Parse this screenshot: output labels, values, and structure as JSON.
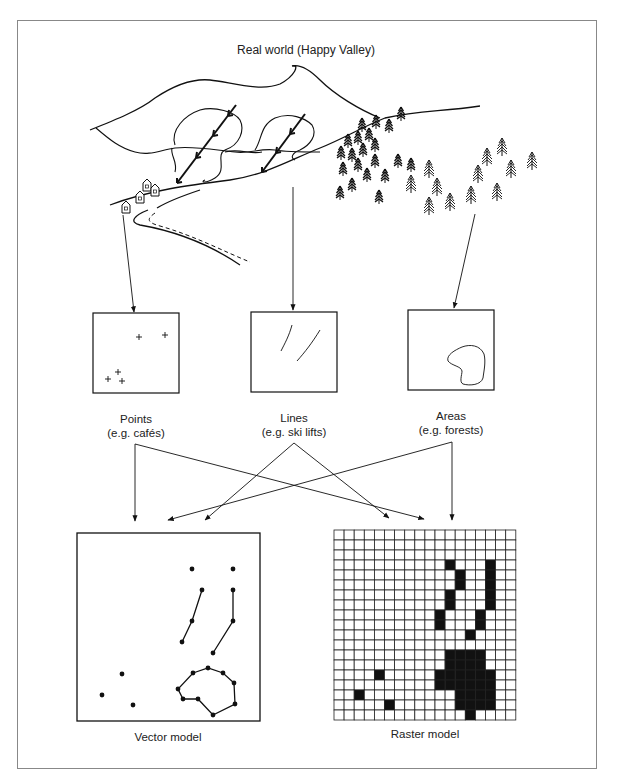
{
  "title": "Real world (Happy Valley)",
  "categories": [
    {
      "name": "Points",
      "example": "(e.g. cafés)"
    },
    {
      "name": "Lines",
      "example": "(e.g. ski lifts)"
    },
    {
      "name": "Areas",
      "example": "(e.g. forests)"
    }
  ],
  "models": {
    "vector": "Vector model",
    "raster": "Raster model"
  },
  "raster_grid": {
    "cols": 18,
    "rows": 19,
    "filled": [
      [
        3,
        11
      ],
      [
        3,
        15
      ],
      [
        4,
        12
      ],
      [
        4,
        15
      ],
      [
        5,
        12
      ],
      [
        5,
        15
      ],
      [
        6,
        11
      ],
      [
        6,
        15
      ],
      [
        7,
        11
      ],
      [
        7,
        15
      ],
      [
        8,
        10
      ],
      [
        8,
        14
      ],
      [
        9,
        10
      ],
      [
        9,
        14
      ],
      [
        10,
        13
      ],
      [
        12,
        11
      ],
      [
        12,
        12
      ],
      [
        12,
        13
      ],
      [
        12,
        14
      ],
      [
        13,
        11
      ],
      [
        13,
        12
      ],
      [
        13,
        13
      ],
      [
        13,
        14
      ],
      [
        14,
        4
      ],
      [
        14,
        10
      ],
      [
        14,
        11
      ],
      [
        14,
        12
      ],
      [
        14,
        13
      ],
      [
        14,
        14
      ],
      [
        14,
        15
      ],
      [
        15,
        10
      ],
      [
        15,
        11
      ],
      [
        15,
        12
      ],
      [
        15,
        13
      ],
      [
        15,
        14
      ],
      [
        15,
        15
      ],
      [
        16,
        2
      ],
      [
        16,
        12
      ],
      [
        16,
        13
      ],
      [
        16,
        14
      ],
      [
        16,
        15
      ],
      [
        17,
        5
      ],
      [
        17,
        12
      ],
      [
        17,
        13
      ],
      [
        17,
        14
      ],
      [
        17,
        15
      ],
      [
        18,
        13
      ]
    ]
  }
}
